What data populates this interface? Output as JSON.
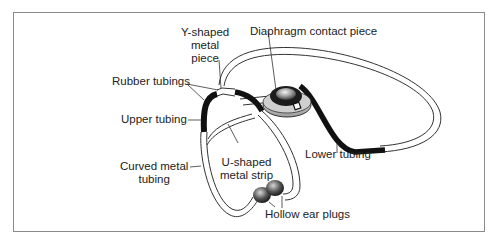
{
  "diagram": {
    "labels": {
      "y_shaped": [
        "Y-shaped",
        "metal",
        "piece"
      ],
      "diaphragm": "Diaphragm contact piece",
      "rubber_tubings": "Rubber tubings",
      "upper_tubing": "Upper tubing",
      "curved_metal": [
        "Curved metal",
        "tubing"
      ],
      "u_shaped": [
        "U-shaped",
        "metal strip"
      ],
      "lower_tubing": "Lower tubing",
      "ear_plugs": "Hollow ear plugs"
    },
    "colors": {
      "frame": "#8a8a8a",
      "tubing": "#111111",
      "outline": "#333333",
      "text": "#222222"
    }
  }
}
